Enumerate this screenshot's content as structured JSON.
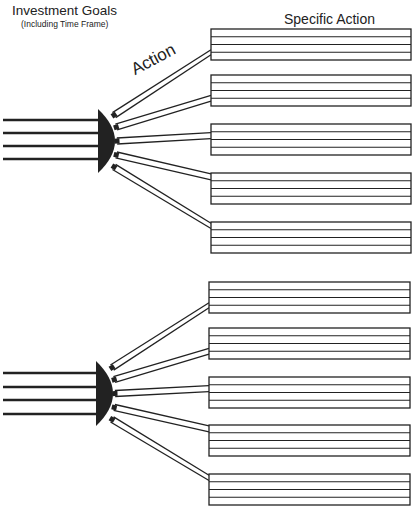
{
  "header": {
    "goals_title": "Investment Goals",
    "goals_subtitle": "(Including Time Frame)",
    "specific_action_title": "Specific Action",
    "action_label": "Action"
  },
  "colors": {
    "ink": "#222222",
    "background": "#ffffff"
  },
  "groups": [
    {
      "input_lines_y": [
        120,
        133,
        146,
        159
      ],
      "hub": {
        "x": 98,
        "top": 109,
        "bottom": 173
      },
      "boxes": [
        {
          "x": 211,
          "y": 29,
          "w": 200,
          "rows": 4
        },
        {
          "x": 211,
          "y": 75,
          "w": 200,
          "rows": 4
        },
        {
          "x": 211,
          "y": 124,
          "w": 200,
          "rows": 4
        },
        {
          "x": 211,
          "y": 173,
          "w": 200,
          "rows": 4
        },
        {
          "x": 211,
          "y": 222,
          "w": 200,
          "rows": 4
        }
      ]
    },
    {
      "input_lines_y": [
        373,
        387,
        400,
        414
      ],
      "hub": {
        "x": 96,
        "top": 361,
        "bottom": 426
      },
      "boxes": [
        {
          "x": 209,
          "y": 282,
          "w": 201,
          "rows": 4
        },
        {
          "x": 209,
          "y": 328,
          "w": 201,
          "rows": 4
        },
        {
          "x": 209,
          "y": 377,
          "w": 201,
          "rows": 4
        },
        {
          "x": 209,
          "y": 425,
          "w": 201,
          "rows": 4
        },
        {
          "x": 209,
          "y": 474,
          "w": 201,
          "rows": 4
        }
      ]
    }
  ]
}
